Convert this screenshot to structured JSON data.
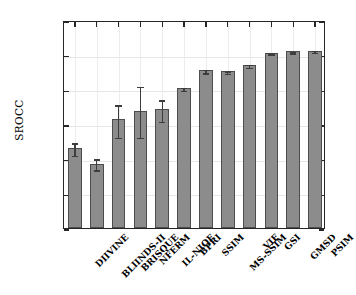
{
  "chart_data": {
    "type": "bar",
    "title": "",
    "xlabel": "",
    "ylabel": "SROCC",
    "ylim": [
      0.7,
      1.0
    ],
    "yticks": [
      0.7,
      0.75,
      0.8,
      0.85,
      0.9,
      0.95,
      1.0
    ],
    "ytick_labels": [
      "0.7",
      "0.75",
      "0.8",
      "0.85",
      "0.9",
      "0.95",
      "1"
    ],
    "grid": true,
    "legend": "none",
    "categories": [
      "DIIVINE",
      "BLIINDS-II",
      "BRISQUE",
      "NFERM",
      "IL-NIQE",
      "BPRI",
      "SSIM",
      "MS-SSIM",
      "VIF",
      "GSI",
      "GMSD",
      "PSIM"
    ],
    "values": [
      0.815,
      0.792,
      0.857,
      0.869,
      0.872,
      0.902,
      0.928,
      0.926,
      0.935,
      0.953,
      0.955,
      0.956
    ],
    "error_low": [
      0.806,
      0.785,
      0.832,
      0.832,
      0.855,
      0.9,
      0.925,
      0.924,
      0.933,
      0.952,
      0.954,
      0.955
    ],
    "error_high": [
      0.824,
      0.801,
      0.879,
      0.906,
      0.886,
      0.904,
      0.93,
      0.928,
      0.937,
      0.954,
      0.956,
      0.957
    ],
    "bar_color": "#8c8c8c",
    "bar_edge_color": "#4d4d4d",
    "error_color": "#3d3d3d",
    "axis_color": "#262626",
    "grid_color": "#e6e6e6",
    "background": "#ffffff"
  }
}
